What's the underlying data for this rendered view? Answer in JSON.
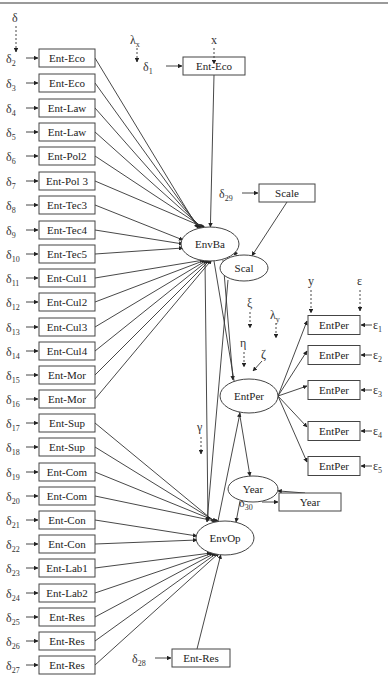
{
  "figure": {
    "type": "structural-equation-model",
    "colors": {
      "line": "#333333",
      "box_border": "#444444",
      "background": "#ffffff"
    }
  },
  "left_indicators": [
    {
      "delta": "2",
      "label": "Ent-Eco",
      "y": 58,
      "target": "EnvBa"
    },
    {
      "delta": "3",
      "label": "Ent-Eco",
      "y": 83,
      "target": "EnvBa"
    },
    {
      "delta": "4",
      "label": "Ent-Law",
      "y": 108,
      "target": "EnvBa"
    },
    {
      "delta": "5",
      "label": "Ent-Law",
      "y": 132,
      "target": "EnvBa"
    },
    {
      "delta": "6",
      "label": "Ent-Pol2",
      "y": 156,
      "target": "EnvBa"
    },
    {
      "delta": "7",
      "label": "Ent-Pol 3",
      "y": 181,
      "target": "EnvBa"
    },
    {
      "delta": "8",
      "label": "Ent-Tec3",
      "y": 205,
      "target": "EnvBa"
    },
    {
      "delta": "9",
      "label": "Ent-Tec4",
      "y": 230,
      "target": "EnvBa"
    },
    {
      "delta": "10",
      "label": "Ent-Tec5",
      "y": 254,
      "target": "EnvBa"
    },
    {
      "delta": "11",
      "label": "Ent-Cul1",
      "y": 278,
      "target": "EnvBa"
    },
    {
      "delta": "12",
      "label": "Ent-Cul2",
      "y": 302,
      "target": "EnvBa"
    },
    {
      "delta": "13",
      "label": "Ent-Cul3",
      "y": 327,
      "target": "EnvBa"
    },
    {
      "delta": "14",
      "label": "Ent-Cul4",
      "y": 351,
      "target": "EnvBa"
    },
    {
      "delta": "15",
      "label": "Ent-Mor",
      "y": 375,
      "target": "EnvBa"
    },
    {
      "delta": "16",
      "label": "Ent-Mor",
      "y": 399,
      "target": "EnvBa"
    },
    {
      "delta": "17",
      "label": "Ent-Sup",
      "y": 423,
      "target": "EnvOp"
    },
    {
      "delta": "18",
      "label": "Ent-Sup",
      "y": 447,
      "target": "EnvOp"
    },
    {
      "delta": "19",
      "label": "Ent-Com",
      "y": 472,
      "target": "EnvOp"
    },
    {
      "delta": "20",
      "label": "Ent-Com",
      "y": 496,
      "target": "EnvOp"
    },
    {
      "delta": "21",
      "label": "Ent-Con",
      "y": 520,
      "target": "EnvOp"
    },
    {
      "delta": "22",
      "label": "Ent-Con",
      "y": 544,
      "target": "EnvOp"
    },
    {
      "delta": "23",
      "label": "Ent-Lab1",
      "y": 568,
      "target": "EnvOp"
    },
    {
      "delta": "24",
      "label": "Ent-Lab2",
      "y": 593,
      "target": "EnvOp"
    },
    {
      "delta": "25",
      "label": "Ent-Res",
      "y": 617,
      "target": "EnvOp"
    },
    {
      "delta": "26",
      "label": "Ent-Res",
      "y": 641,
      "target": "EnvOp"
    },
    {
      "delta": "27",
      "label": "Ent-Res",
      "y": 665,
      "target": "EnvOp"
    }
  ],
  "other_indicators": [
    {
      "delta": "1",
      "label": "Ent-Eco",
      "x": 183,
      "y": 66,
      "w": 62,
      "target": "EnvBa"
    },
    {
      "delta": "29",
      "label": "Scale",
      "x": 259,
      "y": 193,
      "w": 56,
      "target": "Scal"
    },
    {
      "delta": "30",
      "label": "Year",
      "x": 279,
      "y": 502,
      "w": 62,
      "target": "Year"
    },
    {
      "delta": "28",
      "label": "Ent-Res",
      "x": 172,
      "y": 658,
      "w": 58,
      "target": "EnvOp"
    }
  ],
  "latent": [
    {
      "id": "EnvBa",
      "label": "EnvBa",
      "cx": 210,
      "cy": 244,
      "rx": 29,
      "ry": 17
    },
    {
      "id": "Scal",
      "label": "Scal",
      "cx": 244,
      "cy": 268,
      "rx": 24,
      "ry": 13
    },
    {
      "id": "EntPer",
      "label": "EntPer",
      "cx": 249,
      "cy": 396,
      "rx": 29,
      "ry": 17
    },
    {
      "id": "Year",
      "label": "Year",
      "cx": 253,
      "cy": 489,
      "rx": 25,
      "ry": 13
    },
    {
      "id": "EnvOp",
      "label": "EnvOp",
      "cx": 225,
      "cy": 538,
      "rx": 29,
      "ry": 17
    }
  ],
  "right_indicators": [
    {
      "label": "EntPer",
      "eps": "1",
      "y": 325
    },
    {
      "label": "EntPer",
      "eps": "2",
      "y": 355
    },
    {
      "label": "EntPer",
      "eps": "3",
      "y": 390
    },
    {
      "label": "EntPer",
      "eps": "4",
      "y": 431
    },
    {
      "label": "EntPer",
      "eps": "5",
      "y": 466
    }
  ],
  "structural_paths": [
    {
      "from": "EnvBa",
      "to": "EntPer"
    },
    {
      "from": "EnvOp",
      "to": "EntPer"
    },
    {
      "from": "Scal",
      "to": "EnvBa"
    },
    {
      "from": "Scal",
      "to": "EnvOp"
    },
    {
      "from": "EnvBa",
      "to": "EnvOp"
    },
    {
      "from": "EnvBa",
      "to": "Year"
    },
    {
      "from": "Year",
      "to": "EnvOp"
    }
  ],
  "notation_labels": {
    "delta": "δ",
    "lambda_x": "λ",
    "lambda_x_sub": "x",
    "x": "x",
    "xi": "ξ",
    "lambda_y": "λ",
    "lambda_y_sub": "y",
    "eta": "η",
    "zeta": "ζ",
    "gamma": "γ",
    "y": "y",
    "epsilon": "ε"
  }
}
